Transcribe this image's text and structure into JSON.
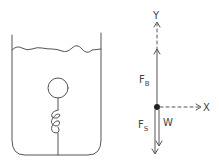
{
  "diagram": {
    "type": "free-body diagram",
    "scene": {
      "container": "beaker",
      "contents": "water",
      "object": "ball on spring anchored to bottom"
    },
    "axes": {
      "y_label": "Y",
      "x_label": "X"
    },
    "forces": [
      {
        "name": "buoyant",
        "label_main": "F",
        "label_sub": "B",
        "direction": "up"
      },
      {
        "name": "spring",
        "label_main": "F",
        "label_sub": "S",
        "direction": "down"
      },
      {
        "name": "weight",
        "label_main": "W",
        "label_sub": "",
        "direction": "down"
      }
    ],
    "colors": {
      "ink": "#555555",
      "background": "#ffffff"
    }
  }
}
